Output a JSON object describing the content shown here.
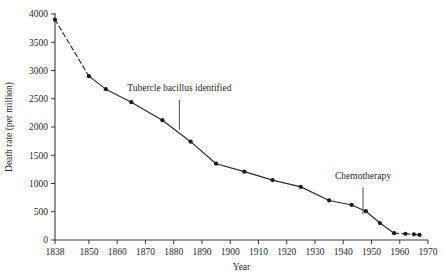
{
  "chart_data": {
    "type": "line",
    "title": "",
    "xlabel": "Year",
    "ylabel": "Death rate (per million)",
    "xlim": [
      1838,
      1970
    ],
    "ylim": [
      0,
      4000
    ],
    "grid": false,
    "legend_position": "none",
    "xticks": [
      "1838",
      "1850",
      "1860",
      "1870",
      "1880",
      "1890",
      "1900",
      "1910",
      "1920",
      "1930",
      "1940",
      "1950",
      "1960",
      "1970"
    ],
    "xtick_values": [
      1838,
      1850,
      1860,
      1870,
      1880,
      1890,
      1900,
      1910,
      1920,
      1930,
      1940,
      1950,
      1960,
      1970
    ],
    "yticks": [
      "0",
      "500",
      "1000",
      "1500",
      "2000",
      "2500",
      "3000",
      "3500",
      "4000"
    ],
    "ytick_values": [
      0,
      500,
      1000,
      1500,
      2000,
      2500,
      3000,
      3500,
      4000
    ],
    "x": [
      1838,
      1850,
      1856,
      1865,
      1876,
      1886,
      1895,
      1905,
      1915,
      1925,
      1935,
      1943,
      1948,
      1953,
      1958,
      1962,
      1965,
      1967
    ],
    "values": [
      3900,
      2900,
      2670,
      2440,
      2120,
      1740,
      1350,
      1210,
      1060,
      940,
      700,
      620,
      510,
      300,
      120,
      110,
      100,
      90
    ],
    "series": [
      {
        "name": "Tuberculosis death rate",
        "x": [
          1838,
          1850,
          1856,
          1865,
          1876,
          1886,
          1895,
          1905,
          1915,
          1925,
          1935,
          1943,
          1948,
          1953,
          1958,
          1962,
          1965,
          1967
        ],
        "values": [
          3900,
          2900,
          2670,
          2440,
          2120,
          1740,
          1350,
          1210,
          1060,
          940,
          700,
          620,
          510,
          300,
          120,
          110,
          100,
          90
        ]
      }
    ],
    "dashed_segments": [
      [
        1838,
        1850
      ],
      [
        1958,
        1962
      ],
      [
        1962,
        1965
      ],
      [
        1965,
        1967
      ]
    ],
    "annotations": [
      {
        "label": "Tubercle bacillus identified",
        "x": 1882,
        "label_y": 2640,
        "leader_top": 2480,
        "leader_bottom": 1950
      },
      {
        "label": "Chemotherapy",
        "x": 1947,
        "label_y": 1080,
        "leader_top": 930,
        "leader_bottom": 460
      }
    ],
    "colors": {
      "line": "#2b2b2b",
      "marker": "#1c1c1c",
      "axis": "#3a3a3a",
      "annotation": "#4a4a4a",
      "background": "#ffffff"
    }
  }
}
